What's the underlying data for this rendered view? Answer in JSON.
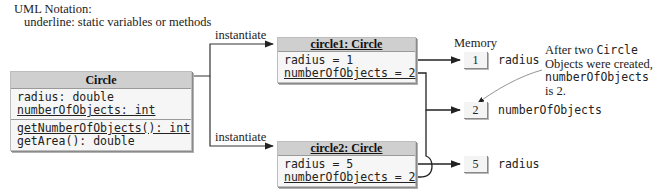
{
  "notation": {
    "title": "UML Notation:",
    "detail": "underline: static variables or methods"
  },
  "class_box": {
    "name": "Circle",
    "fields": [
      {
        "text": "radius: double",
        "static": false
      },
      {
        "text": "numberOfObjects: int",
        "static": true
      }
    ],
    "methods": [
      {
        "text": "getNumberOfObjects(): int",
        "static": true
      },
      {
        "text": "getArea(): double",
        "static": false
      }
    ]
  },
  "arrows": {
    "instantiate_1": "instantiate",
    "instantiate_2": "instantiate"
  },
  "objects": [
    {
      "title": "circle1: Circle",
      "fields": [
        {
          "text": "radius = 1",
          "static": false
        },
        {
          "text": "numberOfObjects = 2",
          "static": true
        }
      ]
    },
    {
      "title": "circle2: Circle",
      "fields": [
        {
          "text": "radius = 5",
          "static": false
        },
        {
          "text": "numberOfObjects = 2",
          "static": true
        }
      ]
    }
  ],
  "memory": {
    "title": "Memory",
    "cells": [
      {
        "value": "1",
        "label": "radius"
      },
      {
        "value": "2",
        "label": "numberOfObjects"
      },
      {
        "value": "5",
        "label": "radius"
      }
    ]
  },
  "callout": {
    "line1_a": "After two ",
    "line1_b": "Circle",
    "line2": "Objects were created,",
    "line3": "numberOfObjects",
    "line4": "is 2."
  }
}
